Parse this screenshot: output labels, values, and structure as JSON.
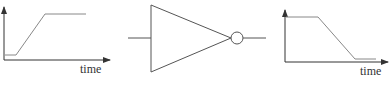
{
  "diagram": {
    "input_plot": {
      "xlabel": "time",
      "signal": "rising ramp from low to high"
    },
    "gate": {
      "type": "NOT (inverter)",
      "icon": "inverter-icon"
    },
    "output_plot": {
      "xlabel": "time",
      "signal": "falling ramp from high to low"
    },
    "colors": {
      "axis": "#333333",
      "signal": "#888888",
      "gate": "#555555"
    }
  }
}
